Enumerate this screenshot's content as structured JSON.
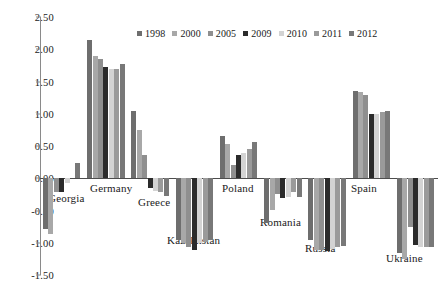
{
  "chart_data": {
    "type": "bar",
    "title": "",
    "subtitle": "",
    "xlabel": "",
    "ylabel": "",
    "ylim": [
      -1.5,
      2.5
    ],
    "ytick_values": [
      2.5,
      2.0,
      1.5,
      1.0,
      0.5,
      0.0,
      -0.5,
      -1.0,
      -1.5
    ],
    "ytick_labels": [
      "2.50",
      "2.00",
      "1.50",
      "1.00",
      "0.50",
      "0.00",
      "-0.50",
      "-1.00",
      "-1.50"
    ],
    "grid": false,
    "legend_position": "top-center",
    "categories": [
      "Georgia",
      "Germany",
      "Greece",
      "Kazakhstan",
      "Poland",
      "Romania",
      "Russia",
      "Spain",
      "Ukraine"
    ],
    "series": [
      {
        "name": "1998",
        "color": "#6e6e6e",
        "values": [
          -0.79,
          2.15,
          1.05,
          -0.96,
          0.65,
          -0.69,
          -0.96,
          1.36,
          -1.16
        ]
      },
      {
        "name": "2000",
        "color": "#a8a8a8",
        "values": [
          -0.87,
          1.9,
          0.75,
          -1.0,
          0.53,
          -0.49,
          -1.11,
          1.33,
          -1.25
        ]
      },
      {
        "name": "2005",
        "color": "#8f8f8f",
        "values": [
          -0.22,
          1.85,
          0.36,
          -1.07,
          0.21,
          -0.25,
          -1.12,
          1.29,
          -0.76
        ]
      },
      {
        "name": "2009",
        "color": "#2b2b2b",
        "values": [
          -0.21,
          1.72,
          -0.15,
          -1.11,
          0.36,
          -0.31,
          -1.13,
          0.99,
          -1.04
        ]
      },
      {
        "name": "2010",
        "color": "#d3d3d3",
        "values": [
          -0.07,
          1.7,
          -0.2,
          -1.01,
          0.39,
          -0.29,
          -1.1,
          1.0,
          -1.06
        ]
      },
      {
        "name": "2011",
        "color": "#9a9a9a",
        "values": [
          0.0,
          1.7,
          -0.22,
          -0.99,
          0.46,
          -0.22,
          -1.06,
          1.03,
          -1.06
        ]
      },
      {
        "name": "2012",
        "color": "#787878",
        "values": [
          0.24,
          1.77,
          -0.27,
          -0.96,
          0.56,
          -0.29,
          -1.05,
          1.04,
          -1.07
        ]
      }
    ]
  },
  "legend": {
    "items": [
      {
        "label": "1998"
      },
      {
        "label": "2000"
      },
      {
        "label": "2005"
      },
      {
        "label": "2009"
      },
      {
        "label": "2010"
      },
      {
        "label": "2011"
      },
      {
        "label": "2012"
      }
    ]
  },
  "axis": {
    "ticks": [
      {
        "label": "2.50"
      },
      {
        "label": "2.00"
      },
      {
        "label": "1.50"
      },
      {
        "label": "1.00"
      },
      {
        "label": "0.50"
      },
      {
        "label": "0.00"
      },
      {
        "label": "-0.50"
      },
      {
        "label": "-1.00"
      },
      {
        "label": "-1.50"
      }
    ]
  },
  "category_labels": [
    {
      "name": "Georgia"
    },
    {
      "name": "Germany"
    },
    {
      "name": "Greece"
    },
    {
      "name": "Kazakhstan"
    },
    {
      "name": "Poland"
    },
    {
      "name": "Romania"
    },
    {
      "name": "Russia"
    },
    {
      "name": "Spain"
    },
    {
      "name": "Ukraine"
    }
  ]
}
